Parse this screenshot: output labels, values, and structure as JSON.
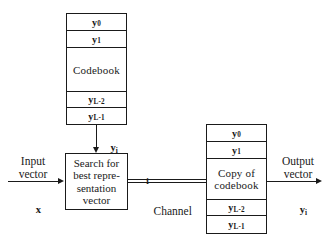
{
  "diagram": {
    "line_color": "#1a1a1a",
    "background": "#ffffff"
  },
  "encoder_codebook": {
    "name": "Codebook",
    "center_label": "Codebook",
    "entries": [
      {
        "symbol": "y",
        "subscript": "0"
      },
      {
        "symbol": "y",
        "subscript": "1"
      },
      {
        "symbol": "y",
        "subscript": "L-2"
      },
      {
        "symbol": "y",
        "subscript": "L-1"
      }
    ]
  },
  "decoder_codebook": {
    "name": "Copy of codebook",
    "center_label_line1": "Copy of",
    "center_label_line2": "codebook",
    "entries": [
      {
        "symbol": "y",
        "subscript": "0"
      },
      {
        "symbol": "y",
        "subscript": "1"
      },
      {
        "symbol": "y",
        "subscript": "L-2"
      },
      {
        "symbol": "y",
        "subscript": "L-1"
      }
    ]
  },
  "search_block": {
    "lines": [
      "Search for",
      "best repre-",
      "sentation",
      "vector"
    ]
  },
  "connectors": {
    "codebook_to_search_label_symbol": "y",
    "codebook_to_search_label_subscript": "i",
    "channel_index_label": "i",
    "channel_label": "Channel"
  },
  "input": {
    "line1": "Input",
    "line2": "vector",
    "symbol": "x",
    "symbol_subscript": ""
  },
  "output": {
    "line1": "Output",
    "line2": "vector",
    "symbol": "y",
    "symbol_subscript": "i"
  }
}
